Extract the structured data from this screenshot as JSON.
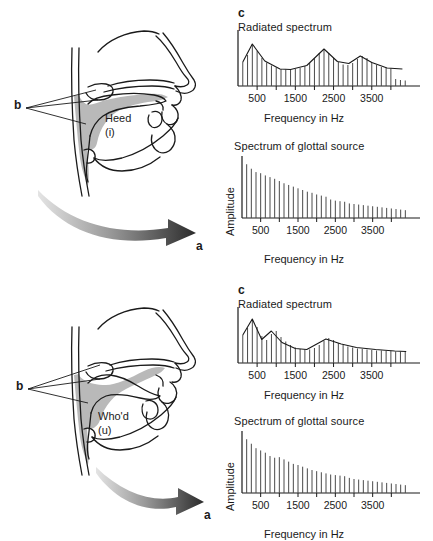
{
  "figure": {
    "panels": [
      {
        "id": "heed",
        "tract": {
          "word": "Heed",
          "symbol": "(i)",
          "label_a": "a",
          "label_b": "b"
        },
        "charts": [
          {
            "panel_letter": "c",
            "title": "Radiated spectrum",
            "xlabel": "Frequency in Hz",
            "ylabel": "",
            "ticks": [
              "500",
              "1500",
              "2500",
              "3500"
            ]
          },
          {
            "panel_letter": "",
            "title": "Spectrum of glottal source",
            "xlabel": "Frequency in Hz",
            "ylabel": "Amplitude",
            "ticks": [
              "500",
              "1500",
              "2500",
              "3500"
            ]
          }
        ]
      },
      {
        "id": "whod",
        "tract": {
          "word": "Who'd",
          "symbol": "(u)",
          "label_a": "a",
          "label_b": "b"
        },
        "charts": [
          {
            "panel_letter": "c",
            "title": "Radiated spectrum",
            "xlabel": "Frequency in Hz",
            "ylabel": "",
            "ticks": [
              "500",
              "1500",
              "2500",
              "3500"
            ]
          },
          {
            "panel_letter": "",
            "title": "Spectrum of glottal source",
            "xlabel": "Frequency in Hz",
            "ylabel": "Amplitude",
            "ticks": [
              "500",
              "1500",
              "2500",
              "3500"
            ]
          }
        ]
      }
    ]
  },
  "colors": {
    "ink": "#1a1a1a",
    "tract_fill": "#b9b9b9",
    "stem": "#4a4a4a",
    "arrow_dark": "#2b2b2b",
    "arrow_light": "#d8d8d8"
  },
  "chart_data": [
    {
      "type": "line",
      "id": "heed-radiated",
      "title": "Radiated spectrum",
      "subtitle": "c",
      "xlabel": "Frequency in Hz",
      "ylabel": "",
      "xlim": [
        0,
        4500
      ],
      "ylim": [
        0,
        100
      ],
      "xticks": [
        500,
        1500,
        2500,
        3500
      ],
      "xticklabels": [
        "500",
        "1500",
        "2500",
        "3500"
      ],
      "grid": false,
      "legend": null,
      "formants": [
        400,
        2300,
        3200
      ],
      "harmonic_spacing": 125,
      "series": [
        {
          "name": "harmonics",
          "x": [
            125,
            250,
            375,
            500,
            625,
            750,
            875,
            1000,
            1125,
            1250,
            1375,
            1500,
            1625,
            1750,
            1875,
            2000,
            2125,
            2250,
            2375,
            2500,
            2625,
            2750,
            2875,
            3000,
            3125,
            3250,
            3375,
            3500,
            3625,
            3750,
            3875,
            4000,
            4125,
            4250,
            4375
          ],
          "values": [
            48,
            62,
            84,
            70,
            56,
            47,
            41,
            37,
            34,
            33,
            33,
            34,
            36,
            40,
            46,
            55,
            66,
            74,
            66,
            56,
            48,
            43,
            42,
            46,
            54,
            60,
            56,
            48,
            42,
            38,
            36,
            35,
            14,
            12,
            11
          ]
        },
        {
          "name": "envelope",
          "x": [
            125,
            375,
            700,
            1100,
            1375,
            1800,
            2250,
            2600,
            2900,
            3200,
            3500,
            3900,
            4300
          ],
          "values": [
            48,
            84,
            50,
            34,
            33,
            41,
            74,
            49,
            45,
            60,
            47,
            36,
            34
          ]
        }
      ]
    },
    {
      "type": "bar",
      "id": "heed-glottal",
      "title": "Spectrum of glottal source",
      "subtitle": "",
      "xlabel": "Frequency in Hz",
      "ylabel": "Amplitude",
      "xlim": [
        0,
        4500
      ],
      "ylim": [
        0,
        100
      ],
      "xticks": [
        500,
        1500,
        2500,
        3500
      ],
      "xticklabels": [
        "500",
        "1500",
        "2500",
        "3500"
      ],
      "grid": false,
      "legend": null,
      "harmonic_spacing": 125,
      "x": [
        125,
        250,
        375,
        500,
        625,
        750,
        875,
        1000,
        1125,
        1250,
        1375,
        1500,
        1625,
        1750,
        1875,
        2000,
        2125,
        2250,
        2375,
        2500,
        2625,
        2750,
        2875,
        3000,
        3125,
        3250,
        3375,
        3500,
        3625,
        3750,
        3875,
        4000,
        4125,
        4250,
        4375
      ],
      "values": [
        96,
        88,
        82,
        80,
        76,
        73,
        70,
        66,
        62,
        59,
        56,
        53,
        50,
        47,
        45,
        42,
        40,
        38,
        33,
        31,
        30,
        29,
        26,
        25,
        24,
        23,
        22,
        21,
        20,
        19,
        18,
        17,
        16,
        15,
        14
      ]
    },
    {
      "type": "line",
      "id": "whod-radiated",
      "title": "Radiated spectrum",
      "subtitle": "c",
      "xlabel": "Frequency in Hz",
      "ylabel": "",
      "xlim": [
        0,
        4500
      ],
      "ylim": [
        0,
        100
      ],
      "xticks": [
        500,
        1500,
        2500,
        3500
      ],
      "xticklabels": [
        "500",
        "1500",
        "2500",
        "3500"
      ],
      "grid": false,
      "legend": null,
      "formants": [
        400,
        900,
        2300
      ],
      "harmonic_spacing": 125,
      "series": [
        {
          "name": "harmonics",
          "x": [
            125,
            250,
            375,
            500,
            625,
            750,
            875,
            1000,
            1125,
            1250,
            1375,
            1500,
            1625,
            1750,
            1875,
            2000,
            2125,
            2250,
            2375,
            2500,
            2625,
            2750,
            2875,
            3000,
            3125,
            3250,
            3375,
            3500,
            3625,
            3750,
            3875,
            4000,
            4125,
            4250,
            4375
          ],
          "values": [
            56,
            70,
            88,
            72,
            54,
            46,
            58,
            64,
            52,
            43,
            36,
            31,
            28,
            27,
            27,
            30,
            36,
            44,
            50,
            46,
            40,
            36,
            33,
            31,
            29,
            28,
            27,
            26,
            25,
            25,
            24,
            24,
            23,
            23,
            22
          ]
        },
        {
          "name": "envelope",
          "x": [
            125,
            375,
            620,
            870,
            1150,
            1500,
            1800,
            2300,
            2700,
            3100,
            3600,
            4100,
            4400
          ],
          "values": [
            56,
            88,
            47,
            64,
            41,
            29,
            27,
            48,
            38,
            31,
            27,
            24,
            23
          ]
        }
      ]
    },
    {
      "type": "bar",
      "id": "whod-glottal",
      "title": "Spectrum of glottal source",
      "subtitle": "",
      "xlabel": "Frequency in Hz",
      "ylabel": "Amplitude",
      "xlim": [
        0,
        4500
      ],
      "ylim": [
        0,
        100
      ],
      "xticks": [
        500,
        1500,
        2500,
        3500
      ],
      "xticklabels": [
        "500",
        "1500",
        "2500",
        "3500"
      ],
      "grid": false,
      "legend": null,
      "harmonic_spacing": 125,
      "x": [
        125,
        250,
        375,
        500,
        625,
        750,
        875,
        1000,
        1125,
        1250,
        1375,
        1500,
        1625,
        1750,
        1875,
        2000,
        2125,
        2250,
        2375,
        2500,
        2625,
        2750,
        2875,
        3000,
        3125,
        3250,
        3375,
        3500,
        3625,
        3750,
        3875,
        4000,
        4125,
        4250,
        4375
      ],
      "values": [
        96,
        88,
        80,
        76,
        72,
        66,
        63,
        64,
        60,
        56,
        52,
        50,
        47,
        44,
        41,
        39,
        37,
        35,
        33,
        32,
        31,
        30,
        27,
        25,
        24,
        23,
        22,
        21,
        20,
        19,
        18,
        17,
        16,
        15,
        14
      ]
    }
  ]
}
